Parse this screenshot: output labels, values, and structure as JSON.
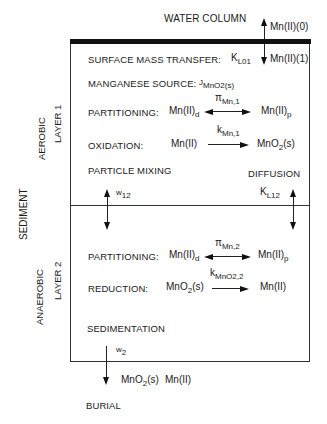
{
  "top": {
    "water_column": "WATER COLUMN",
    "mn_0": "Mn(II)(0)",
    "mn_1": "Mn(II)(1)"
  },
  "side_labels": {
    "sediment": "SEDIMENT",
    "aerobic": "AEROBIC",
    "layer1": "LAYER 1",
    "anaerobic": "ANAEROBIC",
    "layer2": "LAYER 2"
  },
  "layer1": {
    "surface_mass_transfer": {
      "label": "SURFACE MASS TRANSFER:",
      "symbol": "K",
      "sub": "L01"
    },
    "manganese_source": {
      "label": "MANGANESE SOURCE:",
      "symbol": "J",
      "sub": "MnO2(s)"
    },
    "partitioning": {
      "label": "PARTITIONING:",
      "left": "Mn(II)",
      "left_sub": "d",
      "right": "Mn(II)",
      "right_sub": "p",
      "coef": "π",
      "coef_sub": "Mn,1"
    },
    "oxidation": {
      "label": "OXIDATION:",
      "left": "Mn(II)",
      "right": "MnO",
      "right_sub": "2",
      "right_tail": "(s)",
      "coef": "k",
      "coef_sub": "Mn,1"
    },
    "particle_mixing": {
      "label": "PARTICLE MIXING",
      "symbol": "w",
      "sub": "12"
    },
    "diffusion": {
      "label": "DIFFUSION",
      "symbol": "K",
      "sub": "L12"
    }
  },
  "layer2": {
    "partitioning": {
      "label": "PARTITIONING:",
      "left": "Mn(II)",
      "left_sub": "d",
      "right": "Mn(II)",
      "right_sub": "p",
      "coef": "π",
      "coef_sub": "Mn,2"
    },
    "reduction": {
      "label": "REDUCTION:",
      "left": "MnO",
      "left_sub": "2",
      "left_tail": "(s)",
      "right": "Mn(II)",
      "coef": "k",
      "coef_sub": "MnO2,2"
    },
    "sedimentation": {
      "label": "SEDIMENTATION",
      "symbol": "w",
      "sub": "2"
    }
  },
  "bottom": {
    "species1": "MnO",
    "species1_sub": "2",
    "species1_tail": "(s)",
    "species2": "Mn(II)",
    "burial": "BURIAL"
  }
}
